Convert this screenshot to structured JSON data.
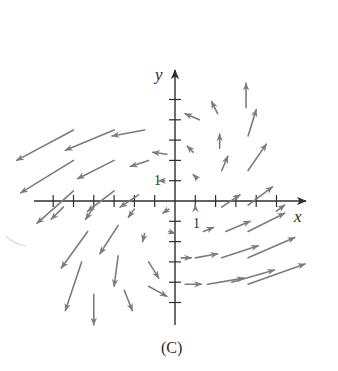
{
  "figure": {
    "caption": "(C)",
    "x_axis_label": "x",
    "y_axis_label": "y",
    "x_unit_label": "1",
    "y_unit_label": "1"
  },
  "colors": {
    "axis": "#2e2e2e",
    "arrow": "#7c7c7c",
    "background": "#ffffff"
  },
  "chart_data": {
    "type": "vector_field",
    "title": "(C)",
    "xlabel": "x",
    "ylabel": "y",
    "xlim": [
      -6,
      6
    ],
    "ylim": [
      -5,
      5
    ],
    "tick_spacing": 1,
    "labeled_ticks": {
      "x": [
        1
      ],
      "y": [
        1
      ]
    },
    "grid": false,
    "arrows": [
      {
        "x": -5,
        "y": 3.5,
        "dx": -2.8,
        "dy": -1.5
      },
      {
        "x": -3,
        "y": 3.5,
        "dx": -2.4,
        "dy": -1.0
      },
      {
        "x": -1.5,
        "y": 3.5,
        "dx": -1.6,
        "dy": -0.3
      },
      {
        "x": -5,
        "y": 2,
        "dx": -2.6,
        "dy": -1.6
      },
      {
        "x": -3,
        "y": 2,
        "dx": -1.8,
        "dy": -0.9
      },
      {
        "x": -1.3,
        "y": 2,
        "dx": -0.9,
        "dy": -0.3
      },
      {
        "x": -0.4,
        "y": 2.3,
        "dx": -0.7,
        "dy": 0.1
      },
      {
        "x": -5,
        "y": 0.5,
        "dx": -1.8,
        "dy": -1.6
      },
      {
        "x": -3,
        "y": 0.5,
        "dx": -1.3,
        "dy": -1.0
      },
      {
        "x": -1.8,
        "y": 0.3,
        "dx": -0.9,
        "dy": -0.6
      },
      {
        "x": -0.5,
        "y": 1.0,
        "dx": -0.3,
        "dy": 0.0
      },
      {
        "x": -5.5,
        "y": -0.3,
        "dx": -0.6,
        "dy": -0.6
      },
      {
        "x": -4,
        "y": -0.3,
        "dx": -0.4,
        "dy": -0.6
      },
      {
        "x": -2.0,
        "y": -0.4,
        "dx": -0.3,
        "dy": -0.4
      },
      {
        "x": -0.3,
        "y": -0.4,
        "dx": -0.3,
        "dy": -0.2
      },
      {
        "x": -4.3,
        "y": -1.5,
        "dx": -1.3,
        "dy": -1.8
      },
      {
        "x": -2.8,
        "y": -1.2,
        "dx": -0.9,
        "dy": -1.4
      },
      {
        "x": -1.5,
        "y": -1.6,
        "dx": -0.1,
        "dy": -0.4
      },
      {
        "x": -0.3,
        "y": -1.5,
        "dx": 0.3,
        "dy": -0.1
      },
      {
        "x": -4.6,
        "y": -3.0,
        "dx": -0.8,
        "dy": -2.4
      },
      {
        "x": -2.8,
        "y": -2.7,
        "dx": -0.2,
        "dy": -1.5
      },
      {
        "x": -1.3,
        "y": -3.0,
        "dx": 0.5,
        "dy": -0.8
      },
      {
        "x": 0.3,
        "y": -2.8,
        "dx": 0.5,
        "dy": 0.0
      },
      {
        "x": -4.0,
        "y": -4.6,
        "dx": 0.0,
        "dy": -1.5
      },
      {
        "x": -2.5,
        "y": -4.4,
        "dx": 0.4,
        "dy": -1.0
      },
      {
        "x": -1.3,
        "y": -4.2,
        "dx": 0.9,
        "dy": -0.5
      },
      {
        "x": 0.5,
        "y": -4.1,
        "dx": 0.8,
        "dy": 0.0
      },
      {
        "x": 1.2,
        "y": 4.0,
        "dx": -0.7,
        "dy": 0.3
      },
      {
        "x": 2.1,
        "y": 4.3,
        "dx": -0.3,
        "dy": 0.6
      },
      {
        "x": 3.5,
        "y": 4.6,
        "dx": 0.0,
        "dy": 1.2
      },
      {
        "x": 0.9,
        "y": 2.4,
        "dx": -0.3,
        "dy": 0.3
      },
      {
        "x": 2.2,
        "y": 2.6,
        "dx": 0.0,
        "dy": 0.7
      },
      {
        "x": 3.6,
        "y": 3.2,
        "dx": 0.4,
        "dy": 1.3
      },
      {
        "x": 1.1,
        "y": 1.1,
        "dx": -0.2,
        "dy": 0.2
      },
      {
        "x": 2.3,
        "y": 1.5,
        "dx": 0.3,
        "dy": 0.7
      },
      {
        "x": 3.6,
        "y": 1.5,
        "dx": 0.9,
        "dy": 1.3
      },
      {
        "x": 1.0,
        "y": -0.3,
        "dx": 0.0,
        "dy": 0.1
      },
      {
        "x": 2.3,
        "y": -0.3,
        "dx": 0.9,
        "dy": 0.6
      },
      {
        "x": 3.6,
        "y": -0.2,
        "dx": 1.2,
        "dy": 0.9
      },
      {
        "x": 5.0,
        "y": -0.5,
        "dx": 0.4,
        "dy": 0.3
      },
      {
        "x": 1.4,
        "y": -1.5,
        "dx": 0.5,
        "dy": 0.2
      },
      {
        "x": 2.5,
        "y": -1.5,
        "dx": 1.2,
        "dy": 0.5
      },
      {
        "x": 3.6,
        "y": -1.5,
        "dx": 1.8,
        "dy": 0.9
      },
      {
        "x": 1.0,
        "y": -2.8,
        "dx": 1.1,
        "dy": 0.2
      },
      {
        "x": 2.3,
        "y": -2.8,
        "dx": 1.8,
        "dy": 0.6
      },
      {
        "x": 3.6,
        "y": -2.8,
        "dx": 2.3,
        "dy": 1.0
      },
      {
        "x": 1.6,
        "y": -4.1,
        "dx": 1.8,
        "dy": 0.3
      },
      {
        "x": 2.8,
        "y": -4.0,
        "dx": 2.1,
        "dy": 0.6
      },
      {
        "x": 3.6,
        "y": -4.1,
        "dx": 2.8,
        "dy": 1.0
      }
    ]
  }
}
